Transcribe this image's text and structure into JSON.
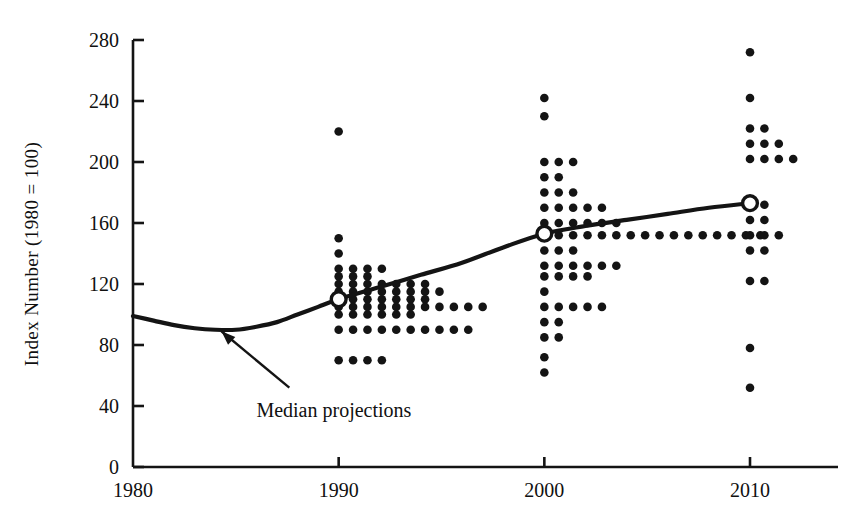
{
  "chart_data": {
    "type": "scatter",
    "title": "",
    "subtitle": "",
    "xlabel": "",
    "ylabel": "Index Number (1980 = 100)",
    "xlim": [
      1980,
      2012
    ],
    "ylim": [
      0,
      280
    ],
    "grid": false,
    "legend": "none",
    "x_ticks": [
      1980,
      1990,
      2000,
      2010
    ],
    "x_tick_labels": [
      "1980",
      "1990",
      "2000",
      "2010"
    ],
    "y_ticks": [
      0,
      40,
      80,
      120,
      160,
      200,
      240,
      280
    ],
    "y_tick_labels": [
      "0",
      "40",
      "80",
      "120",
      "160",
      "200",
      "240",
      "280"
    ],
    "annotations": [
      {
        "text": "Median projections",
        "x": 1986.0,
        "y": 33,
        "arrow_from": [
          1987.6,
          52
        ],
        "arrow_to": [
          1984.3,
          89
        ]
      }
    ],
    "series": [
      {
        "name": "Median projections",
        "type": "line",
        "marker": "open-circle",
        "marker_x": [
          1990,
          2000,
          2010
        ],
        "marker_y": [
          110,
          153,
          173
        ],
        "x": [
          1980,
          1981,
          1982,
          1983,
          1984,
          1985,
          1986,
          1987,
          1988,
          1989,
          1990,
          1992,
          1994,
          1996,
          1998,
          2000,
          2002,
          2004,
          2006,
          2008,
          2010
        ],
        "y": [
          99,
          96,
          93,
          91,
          90,
          90,
          92,
          95,
          100,
          105,
          110,
          118,
          126,
          134,
          144,
          153,
          158,
          162,
          166,
          170,
          173
        ]
      },
      {
        "name": "Individual projections (1990)",
        "type": "dot-histogram",
        "year": 1990,
        "rows": [
          {
            "value": 220,
            "count": 1
          },
          {
            "value": 150,
            "count": 1
          },
          {
            "value": 140,
            "count": 1
          },
          {
            "value": 130,
            "count": 4
          },
          {
            "value": 125,
            "count": 3
          },
          {
            "value": 120,
            "count": 7
          },
          {
            "value": 115,
            "count": 8
          },
          {
            "value": 110,
            "count": 7
          },
          {
            "value": 105,
            "count": 11
          },
          {
            "value": 100,
            "count": 6
          },
          {
            "value": 90,
            "count": 10
          },
          {
            "value": 70,
            "count": 4
          }
        ]
      },
      {
        "name": "Individual projections (2000)",
        "type": "dot-histogram",
        "year": 2000,
        "rows": [
          {
            "value": 242,
            "count": 1
          },
          {
            "value": 230,
            "count": 1
          },
          {
            "value": 200,
            "count": 3
          },
          {
            "value": 190,
            "count": 2
          },
          {
            "value": 180,
            "count": 3
          },
          {
            "value": 170,
            "count": 5
          },
          {
            "value": 160,
            "count": 6
          },
          {
            "value": 152,
            "count": 16
          },
          {
            "value": 142,
            "count": 3
          },
          {
            "value": 132,
            "count": 6
          },
          {
            "value": 125,
            "count": 4
          },
          {
            "value": 115,
            "count": 1
          },
          {
            "value": 105,
            "count": 5
          },
          {
            "value": 95,
            "count": 2
          },
          {
            "value": 85,
            "count": 2
          },
          {
            "value": 72,
            "count": 1
          },
          {
            "value": 62,
            "count": 1
          }
        ]
      },
      {
        "name": "Individual projections (2010)",
        "type": "dot-histogram",
        "year": 2010,
        "rows": [
          {
            "value": 272,
            "count": 1
          },
          {
            "value": 242,
            "count": 1
          },
          {
            "value": 222,
            "count": 2
          },
          {
            "value": 212,
            "count": 3
          },
          {
            "value": 202,
            "count": 4
          },
          {
            "value": 172,
            "count": 2
          },
          {
            "value": 162,
            "count": 2
          },
          {
            "value": 152,
            "count": 3
          },
          {
            "value": 142,
            "count": 2
          },
          {
            "value": 122,
            "count": 2
          },
          {
            "value": 78,
            "count": 1
          },
          {
            "value": 52,
            "count": 1
          }
        ]
      }
    ],
    "colors": {
      "ink": "#141414",
      "background": "#ffffff"
    }
  }
}
